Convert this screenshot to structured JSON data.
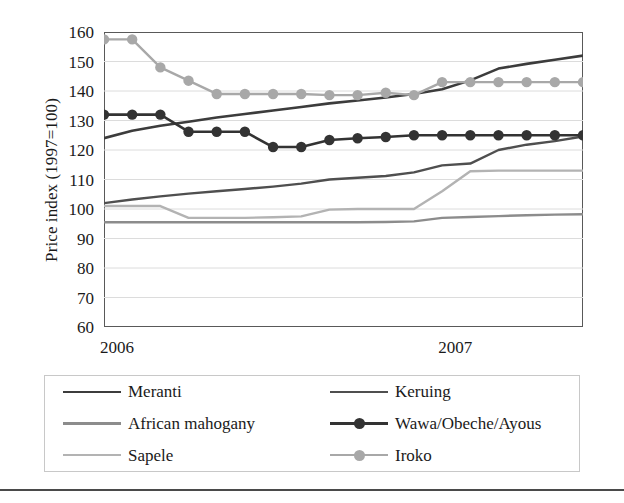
{
  "chart_data": {
    "type": "line",
    "title": "",
    "xlabel": "",
    "ylabel": "Price index (1997=100)",
    "ylim": [
      60,
      160
    ],
    "ytick_values": [
      160,
      150,
      140,
      130,
      120,
      110,
      100,
      90,
      80,
      70,
      60
    ],
    "ytick_labels": [
      "160",
      "150",
      "140",
      "130",
      "120",
      "110",
      "100",
      "90",
      "80",
      "70",
      "60"
    ],
    "grid": true,
    "grid_axis": "y",
    "legend_position": "bottom",
    "x_axis_labels": [
      "2006",
      "2007"
    ],
    "x_label_positions": [
      0.5,
      12.5
    ],
    "x_tick_count": 19,
    "x": [
      0,
      1,
      2,
      3,
      4,
      5,
      6,
      7,
      8,
      9,
      10,
      11,
      12,
      13,
      14,
      15,
      16,
      17
    ],
    "series": [
      {
        "name": "Meranti",
        "color": "#3c3c3c",
        "marker": "none",
        "width": 2.6,
        "values": [
          124.0,
          126.5,
          128.2,
          129.6,
          131.0,
          132.2,
          133.4,
          134.6,
          135.8,
          136.8,
          137.8,
          139.0,
          140.6,
          143.6,
          147.6,
          149.2,
          150.6,
          152.0
        ]
      },
      {
        "name": "Keruing",
        "color": "#4f4f4f",
        "marker": "none",
        "width": 2.4,
        "values": [
          102.0,
          103.2,
          104.3,
          105.2,
          106.0,
          106.8,
          107.6,
          108.6,
          110.0,
          110.6,
          111.2,
          112.4,
          114.8,
          115.4,
          120.0,
          121.8,
          123.0,
          124.6
        ]
      },
      {
        "name": "African mahogany",
        "color": "#8c8c8c",
        "marker": "none",
        "width": 2.4,
        "values": [
          95.5,
          95.5,
          95.5,
          95.5,
          95.5,
          95.5,
          95.5,
          95.5,
          95.5,
          95.5,
          95.6,
          95.8,
          97.0,
          97.3,
          97.6,
          97.9,
          98.1,
          98.2
        ]
      },
      {
        "name": "Wawa/Obeche/Ayous",
        "color": "#333333",
        "marker": "circle",
        "width": 2.6,
        "values": [
          132.0,
          132.0,
          132.0,
          126.2,
          126.2,
          126.2,
          121.0,
          121.0,
          123.4,
          124.0,
          124.4,
          125.0,
          125.0,
          125.0,
          125.0,
          125.0,
          125.0,
          125.0
        ]
      },
      {
        "name": "Sapele",
        "color": "#b3b3b3",
        "marker": "none",
        "width": 2.4,
        "values": [
          101.0,
          101.0,
          101.0,
          97.0,
          97.0,
          97.0,
          97.2,
          97.5,
          99.8,
          100.0,
          100.0,
          100.0,
          106.0,
          112.8,
          113.0,
          113.0,
          113.0,
          113.0
        ]
      },
      {
        "name": "Iroko",
        "color": "#a8a8a8",
        "marker": "circle",
        "width": 2.4,
        "values": [
          157.5,
          157.5,
          148.0,
          143.5,
          139.0,
          139.0,
          139.0,
          139.0,
          138.6,
          138.6,
          139.4,
          138.6,
          143.0,
          143.0,
          143.0,
          143.0,
          143.0,
          143.0
        ]
      }
    ]
  },
  "legend": {
    "items": [
      {
        "label": "Meranti",
        "color": "#3c3c3c",
        "marker": "none"
      },
      {
        "label": "Keruing",
        "color": "#4f4f4f",
        "marker": "none"
      },
      {
        "label": "African mahogany",
        "color": "#8c8c8c",
        "marker": "none"
      },
      {
        "label": "Wawa/Obeche/Ayous",
        "color": "#333333",
        "marker": "circle"
      },
      {
        "label": "Sapele",
        "color": "#b3b3b3",
        "marker": "none"
      },
      {
        "label": "Iroko",
        "color": "#a8a8a8",
        "marker": "circle"
      }
    ]
  },
  "axis": {
    "y_title": "Price index (1997=100)",
    "x_labels": [
      "2006",
      "2007"
    ]
  }
}
